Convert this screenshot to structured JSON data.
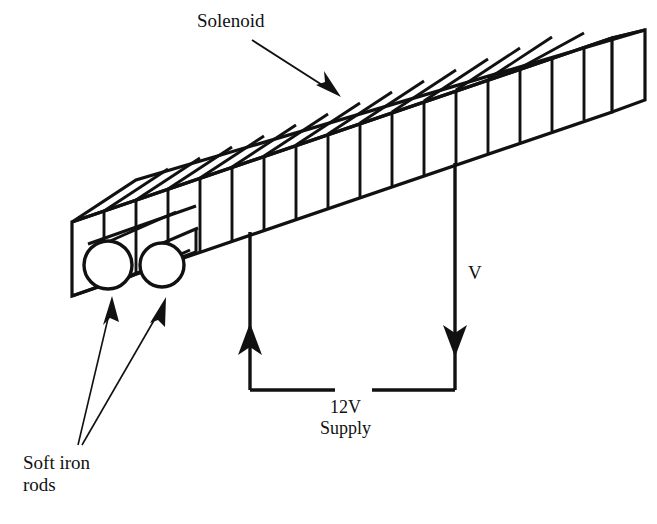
{
  "figure": {
    "background_color": "#ffffff",
    "ink_color": "#111111"
  },
  "labels": {
    "solenoid": "Solenoid",
    "voltage": "V",
    "supply_line1": "12V",
    "supply_line2": "Supply",
    "rods_line1": "Soft iron",
    "rods_line2": "rods"
  },
  "diagram": {
    "solenoid": {
      "shape": "rectangular-prism-isometric",
      "winding_turns": 17,
      "open_end": "left"
    },
    "iron_rods": {
      "count": 2,
      "cross_section": "circle"
    },
    "circuit": {
      "left_wire_arrow": "up",
      "right_wire_arrow": "down",
      "supply_voltage": "12V"
    }
  }
}
